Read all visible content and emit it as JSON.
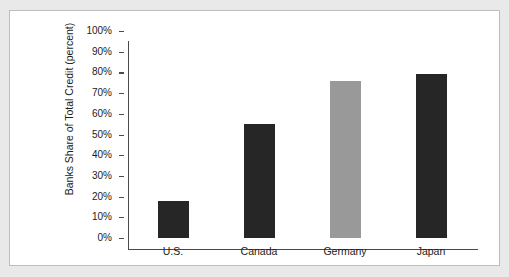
{
  "figure": {
    "background_color": "#e9e9e9",
    "panel_color": "#ffffff",
    "panel_border_color": "#bdbdbd",
    "axis_color": "#4a4a4a"
  },
  "chart_data": {
    "type": "bar",
    "title": "",
    "subtitle": "",
    "xlabel": "",
    "ylabel": "Banks Share of Total Credit (percent)",
    "categories": [
      "U.S.",
      "Canada",
      "Germany",
      "Japan"
    ],
    "values": [
      18,
      55,
      76,
      79
    ],
    "value_labels": [
      "18%",
      "55%",
      "76%",
      "79%"
    ],
    "bar_colors": [
      "#262626",
      "#262626",
      "#999999",
      "#262626"
    ],
    "ylim": [
      0,
      100
    ],
    "ytick_values": [
      0,
      10,
      20,
      30,
      40,
      50,
      60,
      70,
      80,
      90,
      100
    ],
    "ytick_labels": [
      "0%",
      "10%",
      "20%",
      "30%",
      "40%",
      "50%",
      "60%",
      "70%",
      "80%",
      "90%",
      "100%"
    ],
    "grid": false,
    "legend": false,
    "legend_position": "none",
    "annotations": []
  }
}
